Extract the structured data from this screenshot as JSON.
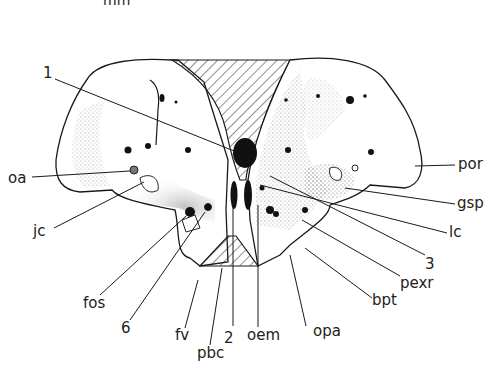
{
  "figure": {
    "top_fragment": "mm",
    "labels": {
      "l1": "1",
      "oa": "oa",
      "jc": "jc",
      "fos": "fos",
      "six": "6",
      "fv": "fv",
      "pbc": "pbc",
      "two": "2",
      "oem": "oem",
      "opa": "opa",
      "bpt": "bpt",
      "pexr": "pexr",
      "three": "3",
      "lc": "lc",
      "gsp": "gsp",
      "por": "por"
    },
    "colors": {
      "ink": "#1a1a1a",
      "stipple": "#888888",
      "background": "#ffffff"
    }
  }
}
